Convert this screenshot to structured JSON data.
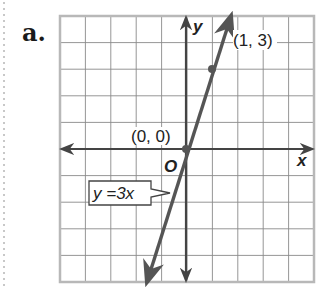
{
  "part_label": "a.",
  "graph": {
    "grid": {
      "x_min": -5,
      "x_max": 5,
      "y_min": -5,
      "y_max": 5,
      "step": 1
    },
    "axes": {
      "x_label": "x",
      "y_label": "y",
      "origin_label": "O"
    },
    "points": [
      {
        "x": 0,
        "y": 0,
        "label": "(0, 0)"
      },
      {
        "x": 1,
        "y": 3,
        "label": "(1, 3)"
      }
    ],
    "line": {
      "equation": "y = 3x",
      "label": "y =3x",
      "slope": 3,
      "intercept": 0
    },
    "colors": {
      "grid": "#8a8a8a",
      "axis": "#444444",
      "line": "#555555",
      "frame": "#b8b8b8",
      "text": "#222222"
    }
  }
}
